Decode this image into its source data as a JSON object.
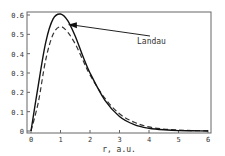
{
  "chart_data": {
    "type": "line",
    "title": "",
    "xlabel": "r, a.u.",
    "ylabel": "",
    "xlim": [
      0,
      6
    ],
    "ylim": [
      0,
      0.62
    ],
    "xticks": [
      "0",
      "1",
      "2",
      "3",
      "4",
      "5",
      "6"
    ],
    "yticks": [
      "0",
      "0.1",
      "0.2",
      "0.3",
      "0.4",
      "0.5",
      "0.6"
    ],
    "grid": false,
    "legend": null,
    "annotations": [
      {
        "text": "Landau",
        "arrow_to": {
          "x": 1.25,
          "y": 0.55
        },
        "text_at": {
          "x": 4.0,
          "y": 0.49
        }
      }
    ],
    "x": [
      0,
      0.25,
      0.5,
      0.75,
      1.0,
      1.25,
      1.5,
      1.75,
      2.0,
      2.5,
      3.0,
      3.5,
      4.0,
      4.5,
      5.0,
      5.5,
      6.0
    ],
    "series": [
      {
        "name": "Landau",
        "style": "solid",
        "values": [
          0,
          0.24,
          0.46,
          0.58,
          0.605,
          0.57,
          0.49,
          0.39,
          0.3,
          0.16,
          0.075,
          0.033,
          0.014,
          0.006,
          0.002,
          0.001,
          0.0
        ]
      },
      {
        "name": "reference",
        "style": "dashed",
        "values": [
          0,
          0.15,
          0.37,
          0.5,
          0.54,
          0.51,
          0.45,
          0.37,
          0.29,
          0.17,
          0.089,
          0.045,
          0.021,
          0.01,
          0.005,
          0.002,
          0.001
        ]
      }
    ]
  }
}
